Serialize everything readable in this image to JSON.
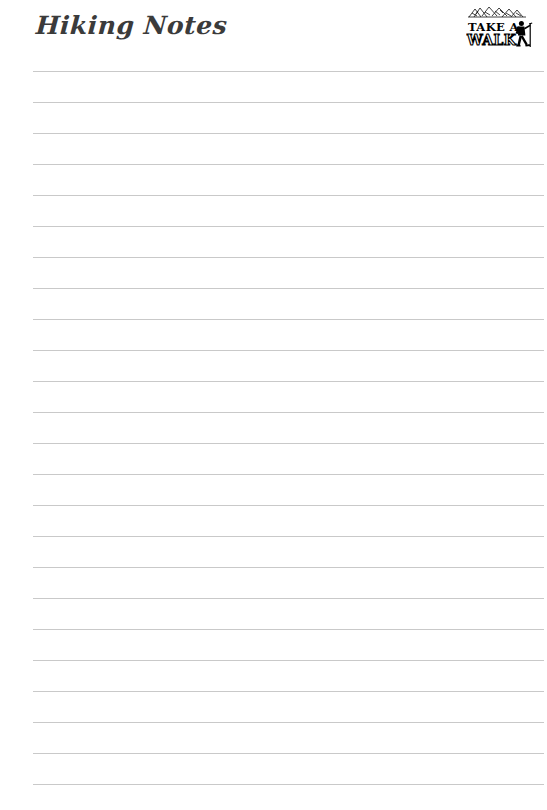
{
  "page": {
    "width": 547,
    "height": 810,
    "background_color": "#ffffff",
    "kind": "lined-notepaper-template"
  },
  "header": {
    "title": "Hiking Notes",
    "title_color": "#3b3b3b"
  },
  "logo": {
    "name": "take-a-walk-logo",
    "line1": "TAKE A",
    "line2": "WALK",
    "color": "#000000",
    "decoration_icon": "mountain-trees-sketch-icon",
    "figure_icon": "hiker-with-backpack-and-trekking-pole-icon"
  },
  "ruled_lines": {
    "count": 24,
    "color": "#c9c9c9",
    "thickness_px": 1,
    "left_px": 33,
    "right_px": 544,
    "first_line_y_px": 71,
    "spacing_px": 31,
    "positions_y": [
      71,
      102,
      133,
      164,
      195,
      226,
      257,
      288,
      319,
      350,
      381,
      412,
      443,
      474,
      505,
      536,
      567,
      598,
      629,
      660,
      691,
      722,
      753,
      784
    ]
  }
}
